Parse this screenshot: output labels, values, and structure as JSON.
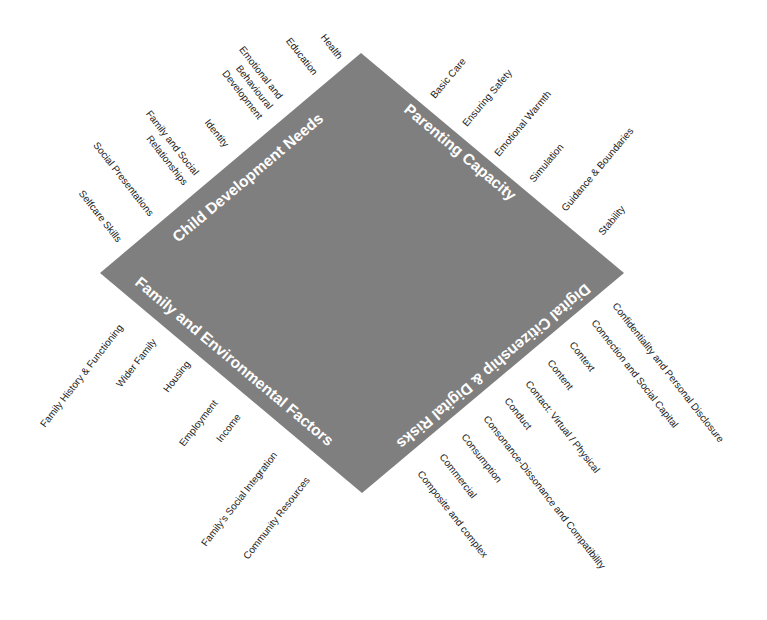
{
  "diagram": {
    "shape_fill": "#7f7f7f",
    "quadrants": {
      "top_left": {
        "title": "Child Development Needs",
        "items": [
          "Health",
          "Education",
          "Emotional and",
          "Behavioural",
          "Development",
          "Identity",
          "Family and Social",
          "Relationships",
          "Social Presentations",
          "Selfcare Skills"
        ]
      },
      "top_right": {
        "title": "Parenting Capacity",
        "items": [
          "Basic Care",
          "Ensuring Safety",
          "Emotional Warmth",
          "Simulation",
          "Guidance & Boundaries",
          "Stability"
        ]
      },
      "bottom_left": {
        "title": "Family and Environmental Factors",
        "items": [
          "Family History & Functioning",
          "Wider Family",
          "Housing",
          "Employment",
          "Income",
          "Family’s Social Integration",
          "Community Resources"
        ]
      },
      "bottom_right": {
        "title": "Digital Citizenship & Digital Risks",
        "items": [
          "Confidentiality and Personal Disclosure",
          "Connection and Social Capital",
          "Context",
          "Content",
          "Contact: Virtual / Physical",
          "Conduct",
          "Consonance-Dissonance and Compatibility",
          "Consumption",
          "Commercial",
          "Composite and complex"
        ]
      }
    }
  }
}
